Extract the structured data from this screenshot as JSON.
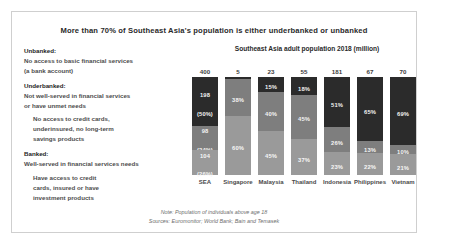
{
  "headline": "More than 70% of Southeast Asia's population is either underbanked or unbanked",
  "legend": {
    "unbanked_head": "Unbanked:",
    "unbanked_body_1": "No access to basic financial services",
    "unbanked_body_2": "(a bank account)",
    "underbanked_head": "Underbanked:",
    "underbanked_body_1": "Not well-served in financial services",
    "underbanked_body_2": "or have unmet needs",
    "underbanked_sub_1": "No access to credit cards,",
    "underbanked_sub_2": "underinsured, no long-term",
    "underbanked_sub_3": "savings products",
    "banked_head": "Banked:",
    "banked_body_1": "Well-served in financial services needs",
    "banked_sub_1": "Have access to credit",
    "banked_sub_2": "cards, insured or have",
    "banked_sub_3": "investment products"
  },
  "footer": {
    "note": "Note: Population of individuals above age 18",
    "sources": "Sources: Euromonitor; World Bank; Bain and Temasek"
  },
  "colors": {
    "unbanked": "#2b2b2b",
    "underbanked": "#7e7e7e",
    "banked": "#9a9a9a",
    "card_border": "#cfcfcf",
    "background": "#ffffff"
  },
  "chart_data": {
    "type": "bar",
    "subtype": "stacked-100-percent",
    "title": "Southeast Asia adult population 2018 (million)",
    "xlabel": "",
    "ylabel": "",
    "ylim": [
      0,
      100
    ],
    "grid": false,
    "legend_position": "left-panel",
    "categories": [
      "SEA",
      "Singapore",
      "Malaysia",
      "Thailand",
      "Indonesia",
      "Philippines",
      "Vietnam"
    ],
    "totals_million": [
      400,
      5,
      23,
      55,
      181,
      67,
      70
    ],
    "series": [
      {
        "name": "Unbanked",
        "values": [
          50,
          2,
          15,
          18,
          51,
          65,
          69
        ]
      },
      {
        "name": "Underbanked",
        "values": [
          24,
          38,
          40,
          45,
          26,
          13,
          10
        ]
      },
      {
        "name": "Banked",
        "values": [
          26,
          60,
          45,
          37,
          23,
          22,
          21
        ]
      }
    ],
    "bars": [
      {
        "category": "SEA",
        "total": "400",
        "segments": [
          {
            "series": "Unbanked",
            "label": "198",
            "sublabel": "(50%)",
            "pct": 50
          },
          {
            "series": "Underbanked",
            "label": "98",
            "sublabel": "(24%)",
            "pct": 24
          },
          {
            "series": "Banked",
            "label": "104",
            "sublabel": "(26%)",
            "pct": 26
          }
        ]
      },
      {
        "category": "Singapore",
        "total": "5",
        "segments": [
          {
            "series": "Unbanked",
            "label": "2%",
            "sublabel": "",
            "pct": 2
          },
          {
            "series": "Underbanked",
            "label": "38%",
            "sublabel": "",
            "pct": 38
          },
          {
            "series": "Banked",
            "label": "60%",
            "sublabel": "",
            "pct": 60
          }
        ]
      },
      {
        "category": "Malaysia",
        "total": "23",
        "segments": [
          {
            "series": "Unbanked",
            "label": "15%",
            "sublabel": "",
            "pct": 15
          },
          {
            "series": "Underbanked",
            "label": "40%",
            "sublabel": "",
            "pct": 40
          },
          {
            "series": "Banked",
            "label": "45%",
            "sublabel": "",
            "pct": 45
          }
        ]
      },
      {
        "category": "Thailand",
        "total": "55",
        "segments": [
          {
            "series": "Unbanked",
            "label": "18%",
            "sublabel": "",
            "pct": 18
          },
          {
            "series": "Underbanked",
            "label": "45%",
            "sublabel": "",
            "pct": 45
          },
          {
            "series": "Banked",
            "label": "37%",
            "sublabel": "",
            "pct": 37
          }
        ]
      },
      {
        "category": "Indonesia",
        "total": "181",
        "segments": [
          {
            "series": "Unbanked",
            "label": "51%",
            "sublabel": "",
            "pct": 51
          },
          {
            "series": "Underbanked",
            "label": "26%",
            "sublabel": "",
            "pct": 26
          },
          {
            "series": "Banked",
            "label": "23%",
            "sublabel": "",
            "pct": 23
          }
        ]
      },
      {
        "category": "Philippines",
        "total": "67",
        "segments": [
          {
            "series": "Unbanked",
            "label": "65%",
            "sublabel": "",
            "pct": 65
          },
          {
            "series": "Underbanked",
            "label": "13%",
            "sublabel": "",
            "pct": 13
          },
          {
            "series": "Banked",
            "label": "22%",
            "sublabel": "",
            "pct": 22
          }
        ]
      },
      {
        "category": "Vietnam",
        "total": "70",
        "segments": [
          {
            "series": "Unbanked",
            "label": "69%",
            "sublabel": "",
            "pct": 69
          },
          {
            "series": "Underbanked",
            "label": "10%",
            "sublabel": "",
            "pct": 10
          },
          {
            "series": "Banked",
            "label": "21%",
            "sublabel": "",
            "pct": 21
          }
        ]
      }
    ]
  }
}
